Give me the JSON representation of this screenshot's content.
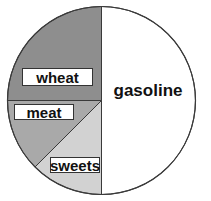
{
  "chart_data": {
    "type": "pie",
    "title": "",
    "start_angle_deg": 0,
    "direction": "clockwise",
    "categories": [
      "gasoline",
      "sweets",
      "meat",
      "wheat"
    ],
    "values": [
      50,
      12.5,
      12.5,
      25
    ],
    "unit": "percent (estimated from slice angles)",
    "slices": [
      {
        "label": "gasoline",
        "value": 50,
        "color": "#ffffff",
        "boxed_label": false
      },
      {
        "label": "sweets",
        "value": 12.5,
        "color": "#d2d2d2",
        "boxed_label": true
      },
      {
        "label": "meat",
        "value": 12.5,
        "color": "#a9a9a9",
        "boxed_label": true
      },
      {
        "label": "wheat",
        "value": 25,
        "color": "#8e8e8e",
        "boxed_label": true
      }
    ],
    "legend": "none (labels placed inside slices)"
  },
  "labels": {
    "gasoline": "gasoline",
    "sweets": "sweets",
    "meat": "meat",
    "wheat": "wheat"
  },
  "colors": {
    "gasoline": "#ffffff",
    "sweets": "#d2d2d2",
    "meat": "#a9a9a9",
    "wheat": "#8e8e8e",
    "outline": "#3a3a3a"
  }
}
